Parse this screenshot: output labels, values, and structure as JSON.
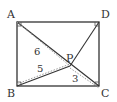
{
  "diagram": {
    "title": "",
    "points": {
      "A": {
        "label": "A",
        "x": 17,
        "y": 22
      },
      "B": {
        "label": "B",
        "x": 17,
        "y": 86
      },
      "C": {
        "label": "C",
        "x": 99,
        "y": 86
      },
      "D": {
        "label": "D",
        "x": 99,
        "y": 22
      },
      "P": {
        "label": "P",
        "x": 70,
        "y": 66
      }
    },
    "lengths": {
      "PA": "6",
      "PB": "5",
      "PC": "3"
    },
    "colors": {
      "line": "#333333",
      "dotted": "#999999",
      "background": "#ffffff"
    }
  }
}
